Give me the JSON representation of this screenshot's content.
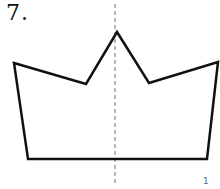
{
  "problem": {
    "number_label": "7."
  },
  "figure": {
    "shape": "crown-polygon",
    "vertices": [
      [
        14,
        63
      ],
      [
        86,
        84
      ],
      [
        117,
        32
      ],
      [
        149,
        83
      ],
      [
        218,
        62
      ],
      [
        207,
        159
      ],
      [
        28,
        159
      ]
    ],
    "stroke_color": "#111111",
    "symmetry_line": {
      "x": 115,
      "y1": 4,
      "y2": 186,
      "color": "#888888",
      "style": "dashed"
    }
  },
  "footer": {
    "page_mark": "1"
  }
}
